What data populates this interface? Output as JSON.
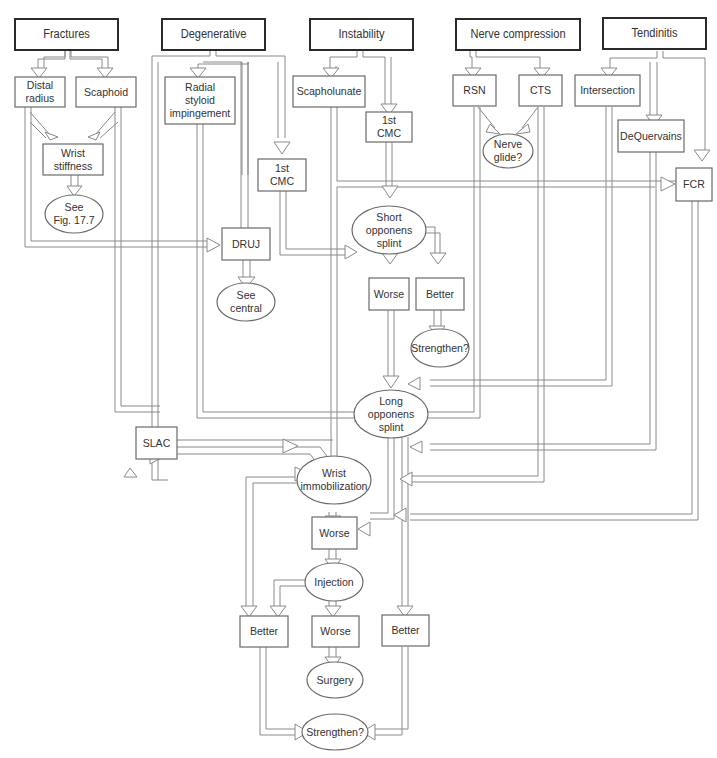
{
  "categories": [
    {
      "id": "fractures",
      "label": "Fractures"
    },
    {
      "id": "degenerative",
      "label": "Degenerative"
    },
    {
      "id": "instability",
      "label": "Instability"
    },
    {
      "id": "nerve",
      "label": "Nerve compression"
    },
    {
      "id": "tendinitis",
      "label": "Tendinitis"
    }
  ],
  "nodes": {
    "distal_radius": "Distal\nradius",
    "scaphoid": "Scaphoid",
    "radial_styloid": "Radial\nstyloid\nimpingement",
    "scapholunate": "Scapholunate",
    "first_cmc_instab": "1st\nCMC",
    "first_cmc_degen": "1st\nCMC",
    "rsn": "RSN",
    "cts": "CTS",
    "intersection": "Intersection",
    "dequervains": "DeQuervains",
    "fcr": "FCR",
    "wrist_stiffness": "Wrist\nstiffness",
    "see_fig": "See\nFig. 17.7",
    "nerve_glide": "Nerve\nglide?",
    "druj": "DRUJ",
    "see_central": "See\ncentral",
    "short_opponens": "Short\nopponens\nsplint",
    "worse_1": "Worse",
    "better_1": "Better",
    "strengthen_1": "Strengthen?",
    "long_opponens": "Long\nopponens\nsplint",
    "slac": "SLAC",
    "wrist_immob": "Wrist\nimmobilization",
    "worse_2": "Worse",
    "injection": "Injection",
    "better_2": "Better",
    "worse_3": "Worse",
    "better_3": "Better",
    "surgery": "Surgery",
    "strengthen_2": "Strengthen?"
  }
}
